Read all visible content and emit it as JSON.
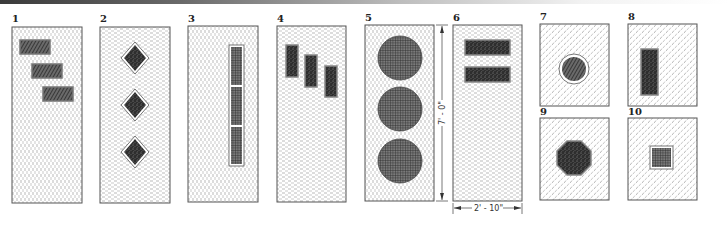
{
  "figure": {
    "type": "door-design-diagrams",
    "panels": [
      {
        "id": "1",
        "label": "1",
        "kind": "tall-door",
        "lights": "three staggered horizontal rectangles, diagonal hatch"
      },
      {
        "id": "2",
        "label": "2",
        "kind": "tall-door",
        "lights": "three diamond lights, stippled"
      },
      {
        "id": "3",
        "label": "3",
        "kind": "tall-door",
        "lights": "one vertical strip, three panes, crosshatch"
      },
      {
        "id": "4",
        "label": "4",
        "kind": "tall-door",
        "lights": "three staggered small vertical rectangles, stippled"
      },
      {
        "id": "5",
        "label": "5",
        "kind": "tall-door",
        "lights": "three large circles, grid hatch"
      },
      {
        "id": "6",
        "label": "6",
        "kind": "tall-door",
        "lights": "two horizontal rectangles, stippled"
      },
      {
        "id": "7",
        "label": "7",
        "kind": "upper-door-detail",
        "lights": "circular light, hatched"
      },
      {
        "id": "8",
        "label": "8",
        "kind": "upper-door-detail",
        "lights": "vertical rectangle, stippled"
      },
      {
        "id": "9",
        "label": "9",
        "kind": "upper-door-detail",
        "lights": "octagonal light, stippled"
      },
      {
        "id": "10",
        "label": "10",
        "kind": "upper-door-detail",
        "lights": "square light, grid hatch"
      }
    ],
    "dimensions": {
      "height": "7' - 0\"",
      "width": "2' - 10\""
    },
    "colors": {
      "line": "#444444",
      "glass_dark": "#2e2e2e",
      "background": "#ffffff"
    }
  }
}
